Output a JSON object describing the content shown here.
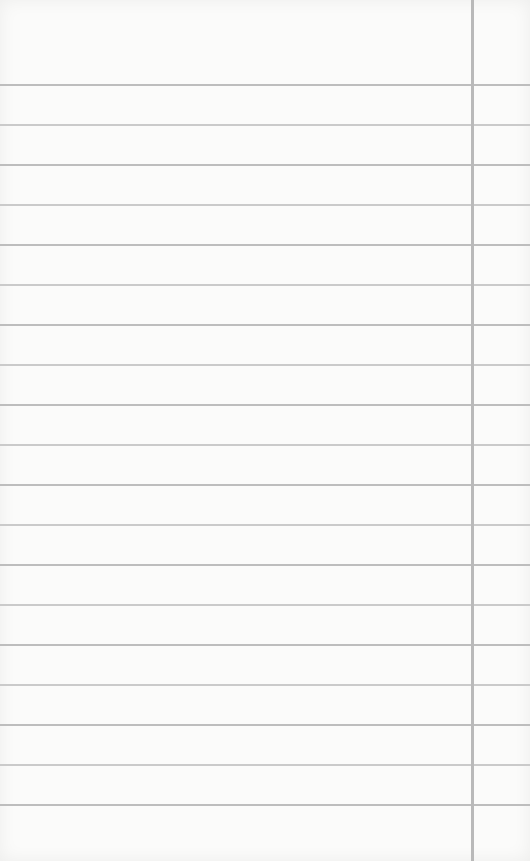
{
  "paper": {
    "background": "#fbfbfa",
    "rule_color": "#cacaca",
    "rule_color_alt": "#bdbdbd",
    "margin_line_color": "#b9b9b9",
    "margin_line_x": 471,
    "first_rule_y": 84,
    "rule_spacing": 40,
    "rule_count": 19
  }
}
